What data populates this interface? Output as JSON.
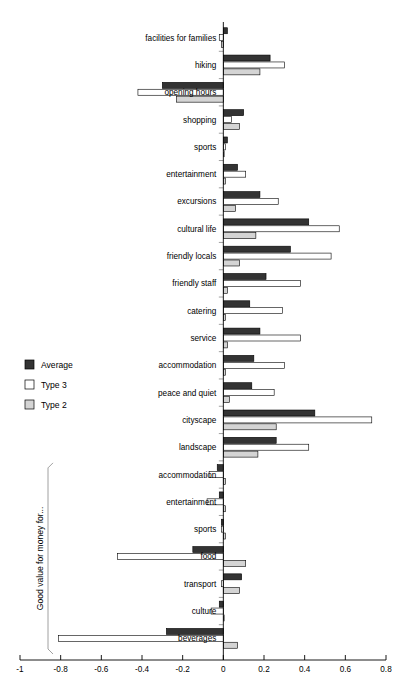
{
  "chart_data": {
    "type": "bar",
    "orientation": "horizontal",
    "title": "",
    "xlabel": "",
    "ylabel": "",
    "xlim": [
      -1,
      0.8
    ],
    "xticks": [
      -1,
      -0.8,
      -0.6,
      -0.4,
      -0.2,
      0,
      0.2,
      0.4,
      0.6,
      0.8
    ],
    "xtick_labels": [
      "-1",
      "-0.8",
      "-0.6",
      "-0.4",
      "-0.2",
      "0",
      "0.2",
      "0.4",
      "0.6",
      "0.8"
    ],
    "grid": false,
    "legend_position": "left-middle",
    "legend": [
      "Average",
      "Type 3",
      "Type 2"
    ],
    "categories": [
      "facilities for families",
      "hiking",
      "opening hours",
      "shopping",
      "sports",
      "entertainment",
      "excursions",
      "cultural life",
      "friendly locals",
      "friendly staff",
      "catering",
      "service",
      "accommodation",
      "peace and quiet",
      "cityscape",
      "landscape",
      "accommodation",
      "entertainment",
      "sports",
      "food",
      "transport",
      "culture",
      "beverages"
    ],
    "series": [
      {
        "name": "Average",
        "color": "#333333",
        "values": [
          0.02,
          0.23,
          -0.3,
          0.1,
          0.02,
          0.07,
          0.18,
          0.42,
          0.33,
          0.21,
          0.13,
          0.18,
          0.15,
          0.14,
          0.45,
          0.26,
          -0.03,
          -0.02,
          -0.01,
          -0.15,
          0.09,
          -0.02,
          -0.28
        ]
      },
      {
        "name": "Type 3",
        "color": "#ffffff",
        "values": [
          -0.02,
          0.3,
          -0.42,
          0.04,
          0.01,
          0.11,
          0.27,
          0.57,
          0.53,
          0.38,
          0.29,
          0.38,
          0.3,
          0.25,
          0.73,
          0.42,
          -0.07,
          -0.08,
          -0.01,
          -0.52,
          -0.01,
          -0.06,
          -0.81
        ]
      },
      {
        "name": "Type 2",
        "color": "#d4d4d4",
        "values": [
          -0.01,
          0.18,
          -0.23,
          0.08,
          0.0,
          0.01,
          0.06,
          0.16,
          0.08,
          0.02,
          0.01,
          0.02,
          0.01,
          0.03,
          0.26,
          0.17,
          0.01,
          0.01,
          0.01,
          0.11,
          0.08,
          0.0,
          0.07
        ]
      }
    ],
    "group_bracket": {
      "label": "Good value for money for...",
      "from_index": 16,
      "to_index": 22
    }
  }
}
